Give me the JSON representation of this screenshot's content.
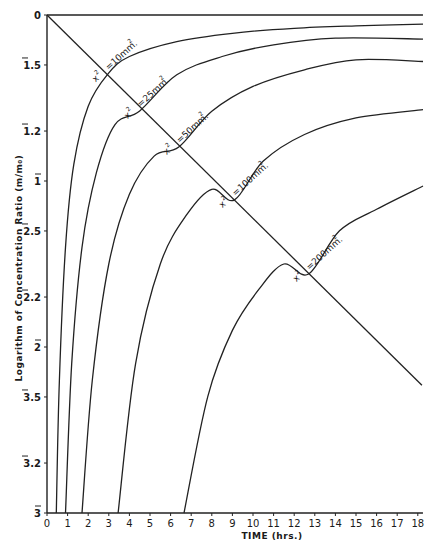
{
  "chart_data": {
    "type": "line",
    "title": "",
    "xlabel": "TIME (hrs.)",
    "ylabel": "Logarithm of Concentration Ratio (m/m₀)",
    "xlim": [
      0,
      18.25
    ],
    "ylim": [
      -3,
      0
    ],
    "grid": false,
    "legend": "none (curves labelled inline at diagonal)",
    "x_ticks": [
      0,
      1,
      2,
      3,
      4,
      5,
      6,
      7,
      8,
      9,
      10,
      11,
      12,
      13,
      14,
      15,
      16,
      17,
      18
    ],
    "x_tick_labels": [
      "0",
      "1",
      "2",
      "3",
      "4",
      "5",
      "6",
      "7",
      "8",
      "9",
      "10",
      "11",
      "12",
      "13",
      "14",
      "15",
      "16",
      "17",
      "18"
    ],
    "y_ticks": [
      {
        "value": 0,
        "label": "0",
        "bar": false,
        "mantissa": ""
      },
      {
        "value": -0.301,
        "label": "1̄.5",
        "bar": true,
        "char": "1",
        "mantissa": ".5"
      },
      {
        "value": -0.699,
        "label": "1̄.2",
        "bar": true,
        "char": "1",
        "mantissa": ".2"
      },
      {
        "value": -1.0,
        "label": "1̄",
        "bar": true,
        "char": "1",
        "mantissa": ""
      },
      {
        "value": -1.301,
        "label": "2̄.5",
        "bar": true,
        "char": "2",
        "mantissa": ".5"
      },
      {
        "value": -1.699,
        "label": "2̄.2",
        "bar": true,
        "char": "2",
        "mantissa": ".2"
      },
      {
        "value": -2.0,
        "label": "2̄",
        "bar": true,
        "char": "2",
        "mantissa": ""
      },
      {
        "value": -2.301,
        "label": "3̄.5",
        "bar": true,
        "char": "3",
        "mantissa": ".5"
      },
      {
        "value": -2.699,
        "label": "3̄.2",
        "bar": true,
        "char": "3",
        "mantissa": ".2"
      },
      {
        "value": -3.0,
        "label": "3̄",
        "bar": true,
        "char": "3",
        "mantissa": ""
      }
    ],
    "series": [
      {
        "name": "x² = 10 mm²",
        "label_main": "=10mm.",
        "x": [
          0.45,
          0.6,
          0.9,
          1.3,
          2.0,
          2.95,
          4.0,
          6.3,
          9.0,
          12.0,
          15.0,
          18.25
        ],
        "y": [
          -3.0,
          -2.2,
          -1.4,
          -0.9,
          -0.55,
          -0.356,
          -0.25,
          -0.16,
          -0.11,
          -0.08,
          -0.065,
          -0.055
        ]
      },
      {
        "name": "x² = 25 mm²",
        "label_main": "=25mm.",
        "x": [
          0.9,
          1.2,
          1.7,
          2.4,
          3.3,
          4.5,
          6.3,
          8.5,
          11.0,
          14.0,
          18.25
        ],
        "y": [
          -3.0,
          -2.1,
          -1.4,
          -0.95,
          -0.66,
          -0.578,
          -0.36,
          -0.25,
          -0.18,
          -0.14,
          -0.145
        ]
      },
      {
        "name": "x² = 50 mm²",
        "label_main": "=50mm.",
        "x": [
          1.7,
          2.2,
          3.0,
          4.0,
          5.2,
          6.4,
          8.0,
          10.0,
          12.5,
          15.0,
          18.25
        ],
        "y": [
          -3.0,
          -2.2,
          -1.5,
          -1.08,
          -0.85,
          -0.795,
          -0.58,
          -0.43,
          -0.33,
          -0.27,
          -0.28
        ]
      },
      {
        "name": "x² = 100 mm²",
        "label_main": "=100mm.",
        "x": [
          3.45,
          4.3,
          5.5,
          6.8,
          8.0,
          9.1,
          10.5,
          12.5,
          15.0,
          18.25
        ],
        "y": [
          -3.0,
          -2.1,
          -1.5,
          -1.2,
          -1.05,
          -1.114,
          -0.88,
          -0.72,
          -0.62,
          -0.57
        ]
      },
      {
        "name": "x² = 200 mm²",
        "label_main": "=200mm.",
        "x": [
          6.65,
          7.8,
          9.0,
          10.3,
          11.5,
          12.7,
          14.2,
          16.0,
          18.25
        ],
        "y": [
          -3.0,
          -2.3,
          -1.9,
          -1.65,
          -1.5,
          -1.56,
          -1.3,
          -1.17,
          -1.03
        ]
      }
    ],
    "reference_lines": [
      {
        "name": "top-baseline",
        "x": [
          0,
          18.25
        ],
        "y": [
          0,
          0
        ]
      },
      {
        "name": "diagonal",
        "x": [
          0,
          18.2
        ],
        "y": [
          0,
          -2.23
        ]
      }
    ],
    "annotations": [
      "x² =10mm.²",
      "x² =25mm.²",
      "x² =50mm.²",
      "x² =100mm.²",
      "x² =200mm.²"
    ],
    "label_positions_hrs": [
      2.95,
      4.5,
      6.4,
      9.1,
      12.7
    ]
  }
}
